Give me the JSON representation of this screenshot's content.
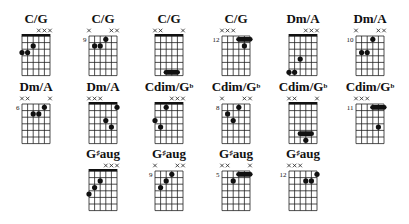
{
  "layout": {
    "strings": 6,
    "frets": 6
  },
  "rows": [
    {
      "chords": [
        {
          "name": "C/G",
          "base": "G",
          "sup": "",
          "rest": "",
          "position": "",
          "nut": true,
          "muted": [
            3,
            4,
            5
          ],
          "dots": [
            [
              2,
              2
            ],
            [
              3,
              0
            ],
            [
              3,
              1
            ]
          ],
          "barres": []
        },
        {
          "name": "C/G",
          "position": "9",
          "nut": false,
          "muted": [
            0,
            4,
            5
          ],
          "dots": [
            [
              1,
              3
            ],
            [
              2,
              1
            ],
            [
              2,
              2
            ]
          ],
          "barres": []
        },
        {
          "name": "C/G",
          "position": "",
          "nut": true,
          "muted": [
            0,
            1,
            5
          ],
          "dots": [],
          "barres": [
            [
              6,
              2,
              4
            ]
          ]
        },
        {
          "name": "C/G",
          "position": "12",
          "nut": false,
          "muted": [
            0,
            1,
            2
          ],
          "dots": [
            [
              2,
              4
            ]
          ],
          "barres": [
            [
              1,
              3,
              5
            ]
          ]
        },
        {
          "name": "Dm/A",
          "position": "",
          "nut": true,
          "muted": [
            3,
            4,
            5
          ],
          "dots": [
            [
              4,
              2
            ],
            [
              6,
              0
            ],
            [
              6,
              1
            ]
          ],
          "barres": []
        },
        {
          "name": "Dm/A",
          "position": "10",
          "nut": false,
          "muted": [
            0,
            4,
            5
          ],
          "dots": [
            [
              1,
              3
            ],
            [
              3,
              1
            ],
            [
              3,
              2
            ]
          ],
          "barres": []
        }
      ]
    },
    {
      "chords": [
        {
          "name": "Dm/A",
          "position": "6",
          "nut": false,
          "muted": [
            0,
            1,
            5
          ],
          "dots": [
            [
              1,
              4
            ],
            [
              2,
              2
            ],
            [
              2,
              3
            ]
          ],
          "barres": []
        },
        {
          "name": "Dm/A",
          "position": "",
          "nut": true,
          "muted": [
            0,
            1,
            2
          ],
          "dots": [
            [
              1,
              5
            ],
            [
              3,
              3
            ],
            [
              4,
              4
            ]
          ],
          "barres": []
        },
        {
          "name": "Cdim/G",
          "sup": "b",
          "position": "",
          "nut": true,
          "muted": [
            3,
            4,
            5
          ],
          "dots": [
            [
              1,
              2
            ],
            [
              3,
              0
            ],
            [
              4,
              1
            ]
          ],
          "barres": []
        },
        {
          "name": "Cdim/G",
          "sup": "b",
          "position": "8",
          "nut": false,
          "muted": [
            0,
            4,
            5
          ],
          "dots": [
            [
              1,
              3
            ],
            [
              2,
              1
            ],
            [
              3,
              2
            ]
          ],
          "barres": []
        },
        {
          "name": "Cdim/G",
          "sup": "b",
          "position": "",
          "nut": true,
          "muted": [
            0,
            1,
            5
          ],
          "dots": [
            [
              6,
              3
            ]
          ],
          "barres": [
            [
              5,
              2,
              4
            ]
          ]
        },
        {
          "name": "Cdim/G",
          "sup": "b",
          "position": "11",
          "nut": false,
          "muted": [
            0,
            1,
            2
          ],
          "dots": [
            [
              4,
              4
            ]
          ],
          "barres": [
            [
              1,
              3,
              5
            ]
          ]
        }
      ]
    },
    {
      "chords": [
        {
          "name": "G",
          "sup": "♯",
          "rest": "aug",
          "position": "",
          "nut": true,
          "muted": [
            3,
            4,
            5
          ],
          "dots": [
            [
              2,
              2
            ],
            [
              3,
              1
            ],
            [
              4,
              0
            ]
          ],
          "barres": []
        },
        {
          "name": "G",
          "sup": "♯",
          "rest": "aug",
          "position": "9",
          "nut": false,
          "muted": [
            0,
            4,
            5
          ],
          "dots": [
            [
              1,
              3
            ],
            [
              2,
              2
            ],
            [
              3,
              1
            ]
          ],
          "barres": []
        },
        {
          "name": "G",
          "sup": "♯",
          "rest": "aug",
          "position": "5",
          "nut": false,
          "muted": [
            0,
            1,
            5
          ],
          "dots": [
            [
              2,
              2
            ]
          ],
          "barres": [
            [
              1,
              3,
              5
            ]
          ]
        },
        {
          "name": "G",
          "sup": "♯",
          "rest": "aug",
          "position": "12",
          "nut": false,
          "muted": [
            0,
            1,
            2
          ],
          "dots": [
            [
              1,
              5
            ],
            [
              2,
              3
            ],
            [
              2,
              4
            ]
          ],
          "barres": []
        }
      ]
    }
  ],
  "labels": {
    "r0": [
      "C/G",
      "C/G",
      "C/G",
      "C/G",
      "Dm/A",
      "Dm/A"
    ],
    "r1": [
      "Dm/A",
      "Dm/A",
      "Cdim/G♭",
      "Cdim/G♭",
      "Cdim/G♭",
      "Cdim/G♭"
    ],
    "r2": [
      "G♯aug",
      "G♯aug",
      "G♯aug",
      "G♯aug"
    ]
  }
}
